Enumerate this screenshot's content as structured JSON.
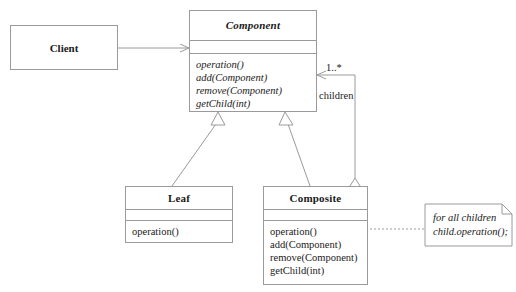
{
  "diagram": {
    "line_color": "#9a9a9a",
    "text_color": "#1a1a1a",
    "background": "#ffffff"
  },
  "classes": {
    "client": {
      "name": "Client",
      "abstract": false
    },
    "component": {
      "name": "Component",
      "abstract": true,
      "attributes": [],
      "operations": [
        "operation()",
        "add(Component)",
        "remove(Component)",
        "getChild(int)"
      ]
    },
    "leaf": {
      "name": "Leaf",
      "abstract": false,
      "attributes": [],
      "operations": [
        "operation()"
      ]
    },
    "composite": {
      "name": "Composite",
      "abstract": false,
      "attributes": [],
      "operations": [
        "operation()",
        "add(Component)",
        "remove(Component)",
        "getChild(int)"
      ]
    }
  },
  "relationships": {
    "aggregation": {
      "multiplicity": "1..*",
      "role": "children"
    }
  },
  "note": {
    "line1": "for all children",
    "line2": "child.operation();"
  }
}
